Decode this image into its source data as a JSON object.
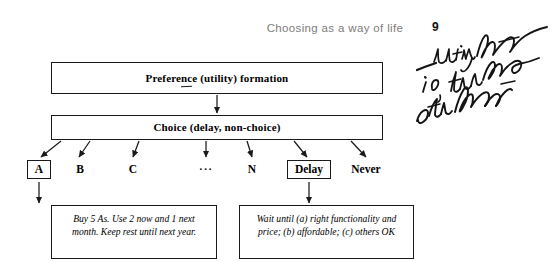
{
  "page": {
    "running_head": "Choosing as a way of life",
    "folio": "9",
    "background_color": "#ffffff",
    "ink_color": "#1a1a1a",
    "running_head_color": "#7d7d7d"
  },
  "diagram": {
    "type": "flowchart",
    "nodes": {
      "preference": {
        "label": "Preference (utility) formation",
        "shape": "rectangle"
      },
      "choice": {
        "label": "Choice (delay, non-choice)",
        "shape": "rectangle"
      }
    },
    "outcomes": [
      {
        "label": "A",
        "boxed": true,
        "left": 27,
        "width": 24
      },
      {
        "label": "B",
        "boxed": false,
        "left": 71,
        "width": 18
      },
      {
        "label": "C",
        "boxed": false,
        "left": 124,
        "width": 18
      },
      {
        "label": "···",
        "boxed": false,
        "left": 196,
        "width": 20
      },
      {
        "label": "N",
        "boxed": false,
        "left": 243,
        "width": 18
      },
      {
        "label": "Delay",
        "boxed": true,
        "left": 287,
        "width": 44
      },
      {
        "label": "Never",
        "boxed": false,
        "left": 345,
        "width": 42
      }
    ],
    "notes": {
      "left": "Buy 5 As. Use 2 now and 1 next month. Keep rest until next year.",
      "right": "Wait until (a) right functionality and price; (b) affordable; (c) others OK"
    }
  },
  "marginalia": {
    "description": "handwritten-annotation",
    "transcription": "utility function i.e., the values of the function"
  }
}
